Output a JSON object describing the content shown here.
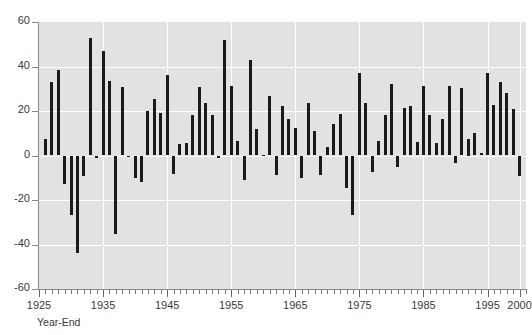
{
  "chart_data": {
    "type": "bar",
    "title": "",
    "xlabel": "Year-End",
    "ylabel": "",
    "ylim": [
      -60,
      60
    ],
    "xlim": [
      1925,
      2001
    ],
    "grid": true,
    "legend": false,
    "bar_color": "#1a1a1a",
    "plot_background": "#e2e2e2",
    "gridline_color": "#ffffff",
    "y_ticks": [
      60,
      40,
      20,
      0,
      -20,
      -40,
      -60
    ],
    "y_tick_labels": [
      "60",
      "40",
      "20",
      "0",
      "-20",
      "-40",
      "-60"
    ],
    "x_ticks": [
      1925,
      1935,
      1945,
      1955,
      1965,
      1975,
      1985,
      1995,
      2000
    ],
    "x_tick_labels": [
      "1925",
      "1935",
      "1945",
      "1955",
      "1965",
      "1975",
      "1985",
      "1995",
      "2000"
    ],
    "x_minor_tick_interval": 1,
    "categories": [
      1926,
      1927,
      1928,
      1929,
      1930,
      1931,
      1932,
      1933,
      1934,
      1935,
      1936,
      1937,
      1938,
      1939,
      1940,
      1941,
      1942,
      1943,
      1944,
      1945,
      1946,
      1947,
      1948,
      1949,
      1950,
      1951,
      1952,
      1953,
      1954,
      1955,
      1956,
      1957,
      1958,
      1959,
      1960,
      1961,
      1962,
      1963,
      1964,
      1965,
      1966,
      1967,
      1968,
      1969,
      1970,
      1971,
      1972,
      1973,
      1974,
      1975,
      1976,
      1977,
      1978,
      1979,
      1980,
      1981,
      1982,
      1983,
      1984,
      1985,
      1986,
      1987,
      1988,
      1989,
      1990,
      1991,
      1992,
      1993,
      1994,
      1995,
      1996,
      1997,
      1998,
      1999,
      2000
    ],
    "values": [
      7.4,
      32.9,
      38.6,
      -13.0,
      -26.6,
      -43.8,
      -9.0,
      52.8,
      -1.2,
      46.8,
      33.4,
      -35.2,
      31.0,
      -0.8,
      -10.0,
      -12.0,
      20.2,
      25.6,
      19.3,
      36.2,
      -8.4,
      5.1,
      5.4,
      18.0,
      30.6,
      23.6,
      18.2,
      -1.3,
      51.8,
      31.1,
      6.4,
      -11.0,
      43.0,
      11.8,
      0.2,
      26.6,
      -8.9,
      22.3,
      16.3,
      12.3,
      -10.3,
      23.7,
      10.8,
      -8.6,
      3.7,
      14.0,
      18.6,
      -14.8,
      -26.6,
      36.9,
      23.6,
      -7.6,
      6.3,
      18.2,
      32.2,
      -5.2,
      21.4,
      22.3,
      6.0,
      31.4,
      18.4,
      5.7,
      16.5,
      31.4,
      -3.4,
      30.4,
      7.5,
      9.9,
      1.2,
      37.1,
      22.7,
      33.1,
      28.3,
      20.9,
      -9.2
    ]
  }
}
